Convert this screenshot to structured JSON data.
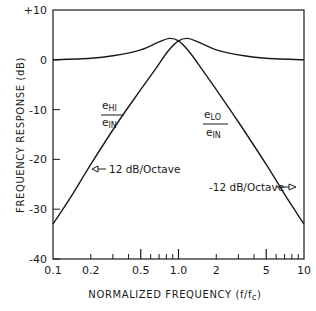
{
  "chart_data": {
    "type": "line",
    "title": "",
    "xlabel": "NORMALIZED FREQUENCY (f/f",
    "xlabel_sub": "c",
    "xlabel_close": ")",
    "ylabel": "FREQUENCY RESPONSE (dB)",
    "xscale": "log",
    "xlim": [
      0.1,
      10
    ],
    "ylim": [
      -40,
      10
    ],
    "grid": false,
    "x_tick_labels": [
      {
        "value": 0.1,
        "label": "0.1"
      },
      {
        "value": 0.2,
        "label": "0.2"
      },
      {
        "value": 0.5,
        "label": "0.5"
      },
      {
        "value": 1.0,
        "label": "1.0"
      },
      {
        "value": 2,
        "label": "2"
      },
      {
        "value": 5,
        "label": "5"
      },
      {
        "value": 10,
        "label": "10"
      }
    ],
    "x_minor_ticks": [
      0.2,
      0.3,
      0.4,
      0.6,
      0.7,
      0.8,
      0.9,
      2,
      3,
      4,
      6,
      7,
      8,
      9
    ],
    "x_major_ticks": [
      0.5,
      1.0,
      5
    ],
    "y_tick_labels": [
      {
        "value": 10,
        "label": "+10"
      },
      {
        "value": 0,
        "label": "0"
      },
      {
        "value": -10,
        "label": "-10"
      },
      {
        "value": -20,
        "label": "-20"
      },
      {
        "value": -30,
        "label": "-30"
      },
      {
        "value": -40,
        "label": "-40"
      }
    ],
    "series": [
      {
        "name": "eHI/eIN",
        "label_main": "e",
        "label_sub": "HI",
        "label_den_main": "e",
        "label_den_sub": "IN",
        "x": [
          0.1,
          0.143,
          0.2,
          0.33,
          0.5,
          0.67,
          0.83,
          1.0,
          1.18,
          1.43,
          2.0,
          3.33,
          5.0,
          10.0
        ],
        "y": [
          -33,
          -27,
          -21,
          -12.5,
          -6,
          -1.5,
          1.8,
          3.8,
          4.3,
          3.6,
          2.0,
          0.8,
          0.3,
          0
        ]
      },
      {
        "name": "eLO/eIN",
        "label_main": "e",
        "label_sub": "LO",
        "label_den_main": "e",
        "label_den_sub": "IN",
        "x": [
          0.1,
          0.2,
          0.3,
          0.5,
          0.7,
          0.85,
          1.0,
          1.2,
          1.5,
          2.0,
          3.0,
          5.0,
          7.0,
          10.0
        ],
        "y": [
          0,
          0.3,
          0.8,
          2.0,
          3.6,
          4.3,
          3.8,
          1.8,
          -1.5,
          -6,
          -12.5,
          -21,
          -27,
          -33
        ]
      }
    ],
    "annotations": [
      {
        "text": "12 dB/Octave",
        "arrow_to": {
          "x": 0.22,
          "y": -21.5
        },
        "side": "left-arrow"
      },
      {
        "text": "-12 dB/Octave",
        "arrow_to": {
          "x": 6.1,
          "y": -25.5
        },
        "side": "right-arrow"
      }
    ]
  }
}
